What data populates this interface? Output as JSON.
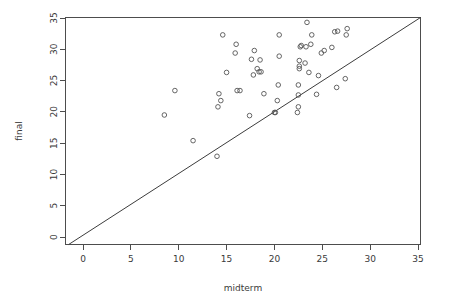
{
  "chart_data": {
    "type": "scatter",
    "title": "",
    "xlabel": "midterm",
    "ylabel": "final",
    "xlim": [
      -1.5,
      36.2
    ],
    "ylim": [
      -1.5,
      36.2
    ],
    "xticks": [
      0,
      5,
      10,
      15,
      20,
      25,
      30,
      35
    ],
    "yticks": [
      0,
      5,
      10,
      15,
      20,
      25,
      30,
      35
    ],
    "xticklabels": [
      "0",
      "5",
      "10",
      "15",
      "20",
      "25",
      "30",
      "35"
    ],
    "yticklabels": [
      "0",
      "5",
      "10",
      "15",
      "20",
      "25",
      "30",
      "35"
    ],
    "grid": false,
    "legend": null,
    "point_marker": "open-circle",
    "point_color": "#555555",
    "line_color": "#3c3c3c",
    "reference_line": {
      "name": "identity-line",
      "type": "abline",
      "slope": 1,
      "intercept": 0,
      "from": [
        -1.5,
        -1.5
      ],
      "to": [
        36.2,
        36.2
      ]
    },
    "points": [
      [
        8.5,
        19.5
      ],
      [
        9.6,
        23.4
      ],
      [
        11.5,
        15.4
      ],
      [
        14.0,
        12.9
      ],
      [
        14.1,
        20.8
      ],
      [
        14.2,
        22.9
      ],
      [
        14.4,
        21.8
      ],
      [
        14.6,
        32.3
      ],
      [
        15.0,
        26.3
      ],
      [
        15.9,
        29.4
      ],
      [
        16.0,
        30.8
      ],
      [
        16.1,
        23.4
      ],
      [
        16.4,
        23.4
      ],
      [
        17.4,
        19.4
      ],
      [
        17.6,
        28.4
      ],
      [
        17.8,
        25.9
      ],
      [
        17.9,
        29.8
      ],
      [
        18.2,
        26.9
      ],
      [
        18.4,
        26.4
      ],
      [
        18.5,
        28.3
      ],
      [
        18.6,
        26.4
      ],
      [
        18.9,
        22.9
      ],
      [
        20.0,
        19.9
      ],
      [
        20.1,
        19.9
      ],
      [
        20.3,
        21.8
      ],
      [
        20.4,
        24.3
      ],
      [
        20.5,
        28.9
      ],
      [
        20.5,
        32.3
      ],
      [
        22.4,
        19.9
      ],
      [
        22.5,
        20.8
      ],
      [
        22.5,
        22.7
      ],
      [
        22.5,
        24.3
      ],
      [
        22.6,
        26.9
      ],
      [
        22.6,
        27.3
      ],
      [
        22.6,
        28.2
      ],
      [
        22.7,
        30.4
      ],
      [
        22.8,
        30.6
      ],
      [
        23.2,
        27.8
      ],
      [
        23.3,
        30.4
      ],
      [
        23.4,
        34.3
      ],
      [
        23.6,
        26.3
      ],
      [
        23.8,
        30.8
      ],
      [
        23.9,
        32.3
      ],
      [
        24.4,
        22.8
      ],
      [
        24.6,
        25.8
      ],
      [
        24.9,
        29.4
      ],
      [
        25.2,
        29.8
      ],
      [
        26.0,
        30.3
      ],
      [
        26.3,
        32.8
      ],
      [
        26.5,
        23.9
      ],
      [
        26.6,
        32.9
      ],
      [
        27.4,
        25.3
      ],
      [
        27.5,
        32.3
      ],
      [
        27.6,
        33.3
      ]
    ]
  },
  "axes": {
    "x_title": "midterm",
    "y_title": "final"
  }
}
